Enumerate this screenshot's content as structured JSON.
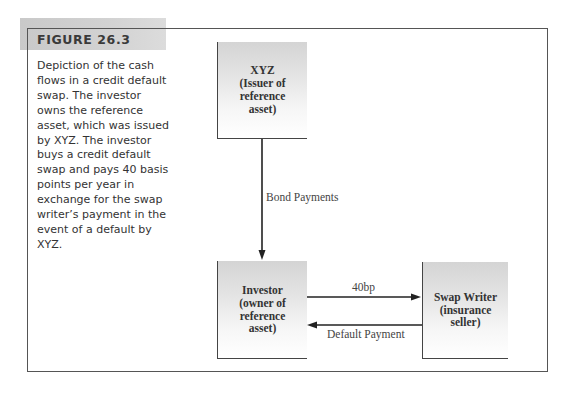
{
  "figure": {
    "title": "FIGURE 26.3",
    "caption": {
      "lines": [
        "Depiction of the cash",
        "flows in a credit default",
        "swap.  The investor",
        "owns the reference",
        "asset, which was issued",
        "by XYZ. The investor",
        "buys a credit default",
        "swap and pays 40 basis",
        "points per year in",
        "exchange for the swap",
        "writer’s payment in the",
        "event of a default by",
        "XYZ."
      ]
    }
  },
  "diagram": {
    "nodes": {
      "xyz": {
        "lines": [
          "XYZ",
          "(Issuer of",
          "reference",
          "asset)"
        ]
      },
      "investor": {
        "lines": [
          "Investor",
          "(owner of",
          "reference",
          "asset)"
        ]
      },
      "swap_writer": {
        "lines": [
          "Swap Writer",
          "(insurance",
          "seller)"
        ]
      }
    },
    "edges": {
      "bond_payments": {
        "from": "XYZ",
        "to": "Investor",
        "label": "Bond Payments"
      },
      "premium": {
        "from": "Investor",
        "to": "Swap Writer",
        "label": "40bp"
      },
      "default_payment": {
        "from": "Swap Writer",
        "to": "Investor",
        "label": "Default Payment"
      }
    },
    "colors": {
      "line": "#222222",
      "frame": "#555555",
      "title_band": "#cfcfcf",
      "node_fill_top": "#d4d4d4"
    }
  }
}
